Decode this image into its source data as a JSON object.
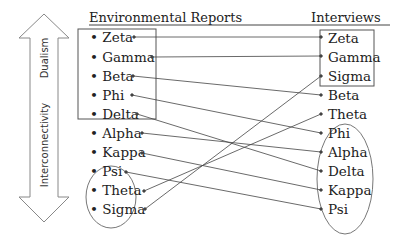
{
  "headers": {
    "left": "Environmental Reports",
    "right": "Interviews"
  },
  "axis": {
    "top_label": "Dualism",
    "bottom_label": "Interconnectivity"
  },
  "left_items": [
    "Zeta",
    "Gamma",
    "Beta",
    "Phi",
    "Delta",
    "Alpha",
    "Kappa",
    "Psi",
    "Theta",
    "Sigma"
  ],
  "right_items": [
    "Zeta",
    "Gamma",
    "Sigma",
    "Beta",
    "Theta",
    "Phi",
    "Alpha",
    "Delta",
    "Kappa",
    "Psi"
  ],
  "groups": {
    "left_box": [
      "Zeta",
      "Gamma",
      "Beta",
      "Phi",
      "Delta"
    ],
    "left_ellipse": [
      "Theta",
      "Sigma"
    ],
    "right_box": [
      "Zeta",
      "Gamma",
      "Sigma"
    ],
    "right_ellipse": [
      "Phi",
      "Alpha",
      "Delta",
      "Kappa",
      "Psi"
    ]
  },
  "connections": [
    [
      "Zeta",
      "Zeta"
    ],
    [
      "Gamma",
      "Gamma"
    ],
    [
      "Beta",
      "Beta"
    ],
    [
      "Phi",
      "Phi"
    ],
    [
      "Delta",
      "Delta"
    ],
    [
      "Alpha",
      "Alpha"
    ],
    [
      "Kappa",
      "Kappa"
    ],
    [
      "Psi",
      "Psi"
    ],
    [
      "Theta",
      "Theta"
    ],
    [
      "Sigma",
      "Sigma"
    ]
  ],
  "bullet": "•"
}
